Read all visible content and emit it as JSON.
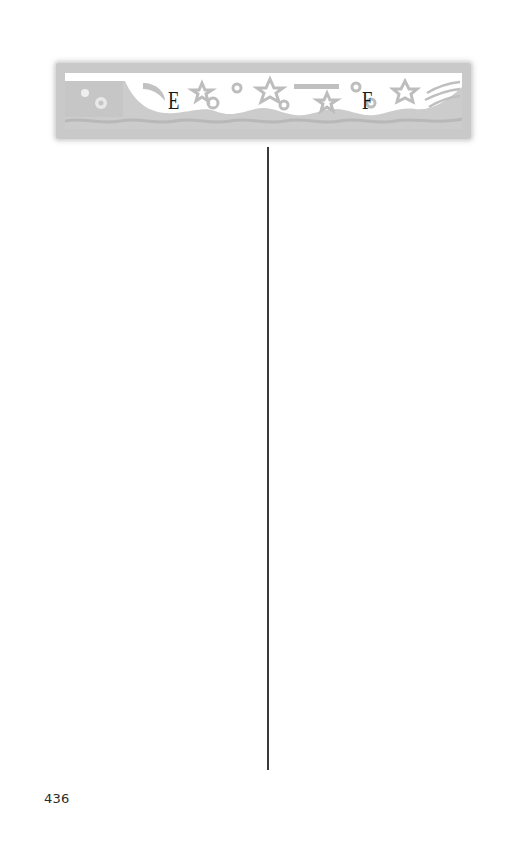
{
  "header": {
    "banner": {
      "left_letter": "E",
      "right_letter": "F",
      "ornament": "decorative-stars-moon-waves-banner",
      "frame_color": "#c9c9c9",
      "letter_color": "#1a1a1a"
    }
  },
  "body": {
    "layout": "two-column",
    "divider_color": "#3a3a3a"
  },
  "footer": {
    "page_number": "436"
  }
}
